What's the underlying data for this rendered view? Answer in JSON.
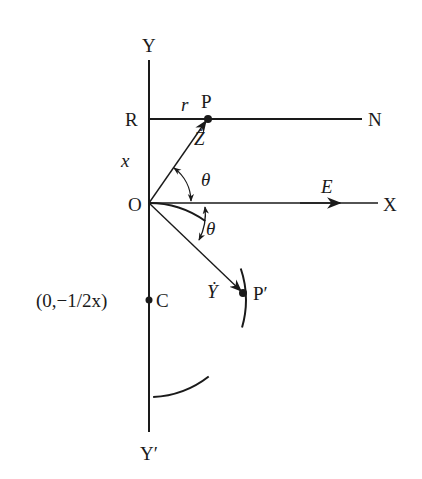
{
  "labels": {
    "y_axis": "Y",
    "y_axis_neg": "Y′",
    "x_axis": "X",
    "origin": "O",
    "point_r": "R",
    "point_n": "N",
    "point_p": "P",
    "point_p_prime": "P′",
    "point_c": "C",
    "c_coord": "(0,−1/2x)",
    "r_label": "r",
    "x_label": "x",
    "z_dot": "Ż",
    "y_dot": "Ẏ",
    "theta_upper": "θ",
    "theta_lower": "θ",
    "field_e": "E"
  },
  "colors": {
    "ink": "#1a1a1a",
    "background": "#ffffff"
  }
}
